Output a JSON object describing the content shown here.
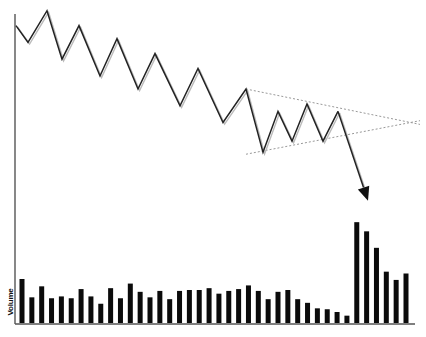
{
  "chart_data": {
    "type": "line",
    "title": "",
    "xlabel": "",
    "ylabel": "Volume",
    "grid": false,
    "legend": "none",
    "price": {
      "name": "Price",
      "x": [
        0,
        1,
        2,
        3,
        4,
        5,
        6,
        7,
        8,
        9,
        10,
        11,
        12,
        13,
        14,
        15,
        16,
        17,
        18,
        19
      ],
      "values": [
        100,
        91,
        108,
        82,
        100,
        73,
        93,
        66,
        85,
        57,
        77,
        48,
        66,
        32,
        54,
        38,
        58,
        38,
        54,
        6
      ],
      "ylim": [
        0,
        110
      ],
      "breakout_arrow": true
    },
    "trendlines": [
      {
        "name": "upper-resistance",
        "from": [
          12,
          66
        ],
        "to": [
          24,
          47
        ]
      },
      {
        "name": "lower-support",
        "from": [
          12,
          31
        ],
        "to": [
          24,
          49
        ]
      }
    ],
    "volume": {
      "name": "Volume",
      "type": "bar",
      "values": [
        48,
        28,
        40,
        27,
        29,
        27,
        37,
        29,
        21,
        38,
        27,
        43,
        34,
        28,
        35,
        26,
        35,
        36,
        36,
        38,
        32,
        35,
        37,
        41,
        35,
        26,
        34,
        36,
        26,
        22,
        16,
        15,
        12,
        8,
        110,
        100,
        82,
        56,
        47,
        54
      ],
      "spike_start_index": 34,
      "ylim": [
        0,
        120
      ]
    },
    "colors": {
      "line": "#222222",
      "line_shadow": "#bbbbbb",
      "trendline": "#999999",
      "bars": "#0b0b0b",
      "axis": "#555555"
    }
  }
}
